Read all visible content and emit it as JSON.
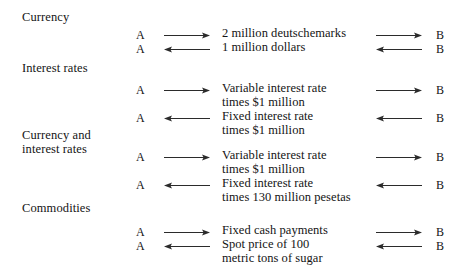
{
  "diagram": {
    "title_visible": false,
    "party_a": "A",
    "party_b": "B",
    "arrow_right": "arrow-right",
    "arrow_left": "arrow-left",
    "colors": {
      "background": "#ffffff",
      "text": "#141414",
      "arrow": "#2b2b2b"
    },
    "sections": [
      {
        "label": "Currency",
        "rows": [
          {
            "from": "A",
            "to": "B",
            "direction": "right",
            "text": "2 million deutschemarks"
          },
          {
            "from": "A",
            "to": "B",
            "direction": "left",
            "text": "1 million dollars"
          }
        ]
      },
      {
        "label": "Interest rates",
        "rows": [
          {
            "from": "A",
            "to": "B",
            "direction": "right",
            "text": "Variable interest rate\ntimes $1 million"
          },
          {
            "from": "A",
            "to": "B",
            "direction": "left",
            "text": "Fixed interest rate\ntimes $1 million"
          }
        ]
      },
      {
        "label": "Currency and\ninterest rates",
        "rows": [
          {
            "from": "A",
            "to": "B",
            "direction": "right",
            "text": "Variable interest rate\ntimes $1 million"
          },
          {
            "from": "A",
            "to": "B",
            "direction": "left",
            "text": "Fixed interest rate\ntimes 130 million pesetas"
          }
        ]
      },
      {
        "label": "Commodities",
        "rows": [
          {
            "from": "A",
            "to": "B",
            "direction": "right",
            "text": "Fixed cash payments"
          },
          {
            "from": "A",
            "to": "B",
            "direction": "left",
            "text": "Spot price of 100\nmetric tons of sugar"
          }
        ]
      }
    ]
  }
}
